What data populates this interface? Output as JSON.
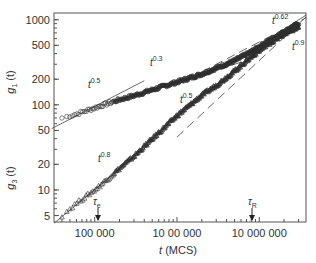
{
  "chart_data": {
    "type": "scatter",
    "title": "",
    "xlabel": "t (MCS)",
    "ylabel_top": "g1 (t)",
    "ylabel_bottom": "g3 (t)",
    "xscale": "log",
    "yscale": "log",
    "xlim": [
      32000,
      37000000
    ],
    "ylim": [
      4.2,
      1200
    ],
    "grid": false,
    "legend": null,
    "x_ticks": [
      {
        "value": 100000,
        "label": "100 000"
      },
      {
        "value": 1000000,
        "label": "10 00 000"
      },
      {
        "value": 10000000,
        "label": "10 000 000"
      }
    ],
    "y_ticks": [
      {
        "value": 1000,
        "label": "1000"
      },
      {
        "value": 500,
        "label": "500"
      },
      {
        "value": 200,
        "label": "200"
      },
      {
        "value": 100,
        "label": "100"
      },
      {
        "value": 50,
        "label": "50"
      },
      {
        "value": 20,
        "label": "20"
      },
      {
        "value": 10,
        "label": "10"
      },
      {
        "value": 5,
        "label": "5"
      }
    ],
    "series": [
      {
        "name": "g1(t)",
        "marker": "circle",
        "x": [
          40000,
          60000,
          100000,
          150000,
          200000,
          300000,
          500000,
          1000000,
          2000000,
          3000000,
          5000000,
          8000000,
          12000000,
          20000000,
          30000000
        ],
        "y": [
          70,
          78,
          92,
          105,
          115,
          128,
          150,
          185,
          230,
          270,
          330,
          420,
          540,
          720,
          900
        ]
      },
      {
        "name": "g3(t)",
        "marker": "triangle",
        "x": [
          40000,
          60000,
          100000,
          150000,
          200000,
          300000,
          500000,
          1000000,
          2000000,
          3000000,
          5000000,
          8000000,
          12000000,
          20000000,
          30000000
        ],
        "y": [
          5,
          7,
          10,
          14,
          18,
          25,
          40,
          75,
          130,
          170,
          250,
          370,
          500,
          680,
          820
        ]
      }
    ],
    "fit_lines": [
      {
        "label": "t^0.5",
        "exponent": 0.5,
        "applies_to": "g1",
        "range": [
          30000,
          400000
        ],
        "style": "solid"
      },
      {
        "label": "t^0.3",
        "exponent": 0.3,
        "applies_to": "g1",
        "range": [
          200000,
          6000000
        ],
        "style": "solid"
      },
      {
        "label": "t^0.62",
        "exponent": 0.62,
        "applies_to": "g1",
        "range": [
          5000000,
          37000000
        ],
        "style": "solid"
      },
      {
        "label": "t^0.8",
        "exponent": 0.8,
        "applies_to": "g3",
        "range": [
          32000,
          600000
        ],
        "style": "solid"
      },
      {
        "label": "t^0.5",
        "exponent": 0.5,
        "applies_to": "g3",
        "range": [
          1000000,
          37000000
        ],
        "style": "dashed"
      },
      {
        "label": "t^0.9",
        "exponent": 0.9,
        "applies_to": "g3",
        "range": [
          1000000,
          37000000
        ],
        "style": "dashed"
      }
    ],
    "annotations": [
      {
        "text": "τe",
        "x": 110000,
        "arrow": "down"
      },
      {
        "text": "τR",
        "x": 6800000,
        "arrow": "down"
      }
    ]
  },
  "labels": {
    "y_top": "g",
    "y_top_sub": "1",
    "y_bottom": "g",
    "y_bottom_sub": "3",
    "y_arg": "(t)",
    "x_var": "t",
    "x_unit": " (MCS)",
    "tau_e": "τ",
    "tau_e_sub": "e",
    "tau_r": "τ",
    "tau_r_sub": "R",
    "t": "t",
    "exp_g1_early": "0.5",
    "exp_g1_mid": "0.3",
    "exp_g1_late": "0.62",
    "exp_g3_early": "0.8",
    "exp_g3_mid": "0.5",
    "exp_g3_late": "0.9"
  }
}
